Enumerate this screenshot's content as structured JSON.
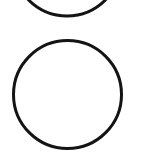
{
  "canvas": {
    "width": 142,
    "height": 158,
    "background": "#ffffff"
  },
  "shapes": [
    {
      "type": "circle",
      "label": "top-circle-partial",
      "cx": 67,
      "cy": -38,
      "r": 54,
      "stroke": "#141414",
      "stroke_width": 3,
      "fill": "none"
    },
    {
      "type": "circle",
      "label": "bottom-circle",
      "cx": 67.5,
      "cy": 94.5,
      "r": 54,
      "stroke": "#141414",
      "stroke_width": 3,
      "fill": "none"
    }
  ]
}
